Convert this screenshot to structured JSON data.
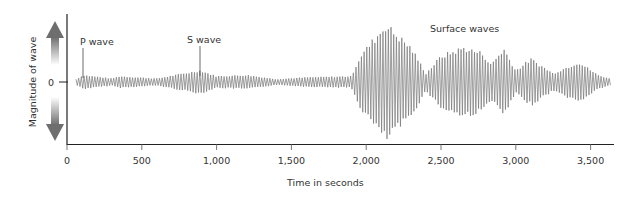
{
  "chart_data": {
    "type": "line",
    "title": "",
    "xlabel": "Time in seconds",
    "ylabel": "Magnitude of wave",
    "xlim": [
      0,
      3650
    ],
    "x_ticks": [
      0,
      500,
      1000,
      1500,
      2000,
      2500,
      3000,
      3500
    ],
    "x_tick_labels": [
      "0",
      "500",
      "1,000",
      "1,500",
      "2,000",
      "2,500",
      "3,000",
      "3,500"
    ],
    "y_ticks": [
      0
    ],
    "y_tick_labels": [
      "0"
    ],
    "grid": false,
    "legend": null,
    "annotations": [
      {
        "text": "P wave",
        "x": 110
      },
      {
        "text": "S wave",
        "x": 890
      },
      {
        "text": "Surface waves",
        "x": 2450
      }
    ],
    "series": [
      {
        "name": "Seismogram amplitude envelope",
        "envelope": [
          {
            "t": 60,
            "amp": 0.05
          },
          {
            "t": 110,
            "amp": 0.12
          },
          {
            "t": 300,
            "amp": 0.06
          },
          {
            "t": 350,
            "amp": 0.1
          },
          {
            "t": 600,
            "amp": 0.06
          },
          {
            "t": 890,
            "amp": 0.2
          },
          {
            "t": 1000,
            "amp": 0.1
          },
          {
            "t": 1200,
            "amp": 0.12
          },
          {
            "t": 1400,
            "amp": 0.05
          },
          {
            "t": 1600,
            "amp": 0.08
          },
          {
            "t": 1900,
            "amp": 0.1
          },
          {
            "t": 1960,
            "amp": 0.45
          },
          {
            "t": 2130,
            "amp": 1.0
          },
          {
            "t": 2300,
            "amp": 0.6
          },
          {
            "t": 2400,
            "amp": 0.15
          },
          {
            "t": 2500,
            "amp": 0.45
          },
          {
            "t": 2650,
            "amp": 0.6
          },
          {
            "t": 2780,
            "amp": 0.5
          },
          {
            "t": 2830,
            "amp": 0.3
          },
          {
            "t": 2920,
            "amp": 0.58
          },
          {
            "t": 3000,
            "amp": 0.2
          },
          {
            "t": 3100,
            "amp": 0.4
          },
          {
            "t": 3250,
            "amp": 0.15
          },
          {
            "t": 3420,
            "amp": 0.35
          },
          {
            "t": 3550,
            "amp": 0.12
          },
          {
            "t": 3640,
            "amp": 0.05
          }
        ]
      }
    ]
  },
  "labels": {
    "xlabel": "Time in seconds",
    "ylabel": "Magnitude of wave",
    "zero": "0",
    "p_wave": "P wave",
    "s_wave": "S wave",
    "surface": "Surface waves",
    "ticks": [
      "0",
      "500",
      "1,000",
      "1,500",
      "2,000",
      "2,500",
      "3,000",
      "3,500"
    ]
  },
  "colors": {
    "axis": "#222222",
    "wave": "#777777",
    "arrow": "#6e6e6e"
  }
}
